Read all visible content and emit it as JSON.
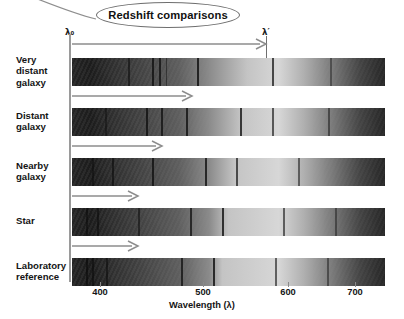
{
  "title": {
    "text": "Redshift comparisons"
  },
  "markers": {
    "lambda_rest_label": "λ₀",
    "lambda_shifted_label": "λ′",
    "lambda_rest_x": 70,
    "lambda_shifted_x": 266
  },
  "axis": {
    "title": "Wavelength (λ)",
    "ticks": [
      {
        "label": "400",
        "x": 100
      },
      {
        "label": "500",
        "x": 203
      },
      {
        "label": "600",
        "x": 288
      },
      {
        "label": "700",
        "x": 355
      }
    ],
    "range_nm": [
      370,
      730
    ]
  },
  "rows": [
    {
      "label": "Very distant galaxy",
      "label_lines": [
        "Very",
        "distant",
        "galaxy"
      ],
      "top": 58,
      "arrow": {
        "top": 38,
        "x": 72,
        "length": 194,
        "visible": true
      },
      "shift_px": 194,
      "lines": [
        {
          "x": 128,
          "w": 1.6,
          "dark": 0.55
        },
        {
          "x": 152,
          "w": 2.2,
          "dark": 0.72
        },
        {
          "x": 159,
          "w": 2.0,
          "dark": 0.7
        },
        {
          "x": 166,
          "w": 1.4,
          "dark": 0.45
        },
        {
          "x": 197,
          "w": 2.0,
          "dark": 0.78
        },
        {
          "x": 272,
          "w": 2.2,
          "dark": 0.7
        },
        {
          "x": 330,
          "w": 1.6,
          "dark": 0.4
        }
      ],
      "bright_center": 0.56
    },
    {
      "label": "Distant galaxy",
      "label_lines": [
        "Distant",
        "galaxy"
      ],
      "top": 108,
      "arrow": {
        "top": 90,
        "x": 72,
        "length": 120,
        "visible": true
      },
      "shift_px": 120,
      "lines": [
        {
          "x": 105,
          "w": 1.6,
          "dark": 0.45
        },
        {
          "x": 146,
          "w": 2.0,
          "dark": 0.72
        },
        {
          "x": 161,
          "w": 2.0,
          "dark": 0.7
        },
        {
          "x": 186,
          "w": 2.0,
          "dark": 0.74
        },
        {
          "x": 240,
          "w": 2.2,
          "dark": 0.76
        },
        {
          "x": 272,
          "w": 2.0,
          "dark": 0.62
        },
        {
          "x": 328,
          "w": 2.0,
          "dark": 0.48
        }
      ],
      "bright_center": 0.54
    },
    {
      "label": "Nearby galaxy",
      "label_lines": [
        "Nearby",
        "galaxy"
      ],
      "top": 158,
      "arrow": {
        "top": 140,
        "x": 72,
        "length": 90,
        "visible": true
      },
      "shift_px": 90,
      "lines": [
        {
          "x": 92,
          "w": 1.8,
          "dark": 0.48
        },
        {
          "x": 112,
          "w": 2.0,
          "dark": 0.6
        },
        {
          "x": 152,
          "w": 2.0,
          "dark": 0.72
        },
        {
          "x": 205,
          "w": 2.2,
          "dark": 0.76
        },
        {
          "x": 236,
          "w": 2.0,
          "dark": 0.66
        },
        {
          "x": 298,
          "w": 2.0,
          "dark": 0.52
        }
      ],
      "bright_center": 0.52
    },
    {
      "label": "Star",
      "label_lines": [
        "Star"
      ],
      "top": 208,
      "arrow": {
        "top": 190,
        "x": 72,
        "length": 66,
        "visible": true
      },
      "shift_px": 66,
      "lines": [
        {
          "x": 86,
          "w": 1.8,
          "dark": 0.52
        },
        {
          "x": 97,
          "w": 1.6,
          "dark": 0.55
        },
        {
          "x": 138,
          "w": 1.8,
          "dark": 0.52
        },
        {
          "x": 190,
          "w": 2.0,
          "dark": 0.7
        },
        {
          "x": 222,
          "w": 2.2,
          "dark": 0.78
        },
        {
          "x": 283,
          "w": 2.0,
          "dark": 0.58
        },
        {
          "x": 335,
          "w": 1.8,
          "dark": 0.42
        }
      ],
      "bright_center": 0.5
    },
    {
      "label": "Laboratory reference",
      "label_lines": [
        "Laboratory",
        "reference"
      ],
      "top": 258,
      "arrow": {
        "top": 240,
        "x": 72,
        "length": 66,
        "visible": true
      },
      "shift_px": 0,
      "lines": [
        {
          "x": 86,
          "w": 2.0,
          "dark": 0.62
        },
        {
          "x": 92,
          "w": 1.6,
          "dark": 0.58
        },
        {
          "x": 106,
          "w": 1.8,
          "dark": 0.55
        },
        {
          "x": 181,
          "w": 2.0,
          "dark": 0.7
        },
        {
          "x": 213,
          "w": 2.2,
          "dark": 0.78
        },
        {
          "x": 275,
          "w": 2.0,
          "dark": 0.58
        },
        {
          "x": 327,
          "w": 1.8,
          "dark": 0.44
        }
      ],
      "bright_center": 0.48
    }
  ],
  "colors": {
    "axis": "#9a9a9a",
    "arrow": "#8d8d8d",
    "text": "#141414",
    "callout_border": "#6e6e6e"
  },
  "chart_data": {
    "type": "heatmap",
    "title": "Redshift comparisons",
    "xlabel": "Wavelength (λ)",
    "ylabel": "",
    "xlim": [
      370,
      730
    ],
    "tick_labels": [
      "400",
      "500",
      "600",
      "700"
    ],
    "categories": [
      "Very distant galaxy",
      "Distant galaxy",
      "Nearby galaxy",
      "Star",
      "Laboratory reference"
    ],
    "series": [
      {
        "name": "Very distant galaxy",
        "redshift_px": 194
      },
      {
        "name": "Distant galaxy",
        "redshift_px": 120
      },
      {
        "name": "Nearby galaxy",
        "redshift_px": 90
      },
      {
        "name": "Star",
        "redshift_px": 66
      },
      {
        "name": "Laboratory reference",
        "redshift_px": 0
      }
    ],
    "annotations": [
      "λ₀",
      "λ′"
    ],
    "grid": false,
    "legend": "none"
  }
}
